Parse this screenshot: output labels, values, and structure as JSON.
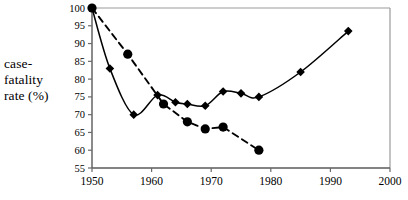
{
  "chart_data": {
    "type": "line",
    "title": "",
    "xlabel": "",
    "ylabel": "case-fatality rate (%)",
    "xlim": [
      1950,
      2000
    ],
    "ylim": [
      55,
      100
    ],
    "xticks": [
      1950,
      1960,
      1970,
      1980,
      1990,
      2000
    ],
    "yticks": [
      55,
      60,
      65,
      70,
      75,
      80,
      85,
      90,
      95,
      100
    ],
    "grid": false,
    "legend": "none",
    "series": [
      {
        "name": "solid-diamond-series",
        "style": "solid",
        "marker": "diamond",
        "color": "#000000",
        "points": [
          {
            "x": 1950,
            "y": 100
          },
          {
            "x": 1953,
            "y": 83
          },
          {
            "x": 1957,
            "y": 70
          },
          {
            "x": 1961,
            "y": 75.5
          },
          {
            "x": 1964,
            "y": 73.5
          },
          {
            "x": 1966,
            "y": 73
          },
          {
            "x": 1969,
            "y": 72.5
          },
          {
            "x": 1972,
            "y": 76.5
          },
          {
            "x": 1975,
            "y": 76
          },
          {
            "x": 1978,
            "y": 75
          },
          {
            "x": 1985,
            "y": 82
          },
          {
            "x": 1993,
            "y": 93.5
          }
        ]
      },
      {
        "name": "dashed-circle-series",
        "style": "dashed",
        "marker": "circle",
        "color": "#000000",
        "points": [
          {
            "x": 1950,
            "y": 100
          },
          {
            "x": 1956,
            "y": 87
          },
          {
            "x": 1962,
            "y": 73
          },
          {
            "x": 1966,
            "y": 68
          },
          {
            "x": 1969,
            "y": 66
          },
          {
            "x": 1972,
            "y": 66.5
          },
          {
            "x": 1978,
            "y": 60
          }
        ]
      }
    ]
  },
  "axis_label": {
    "line1": "case-",
    "line2": "fatality",
    "line3": "rate (%)"
  }
}
